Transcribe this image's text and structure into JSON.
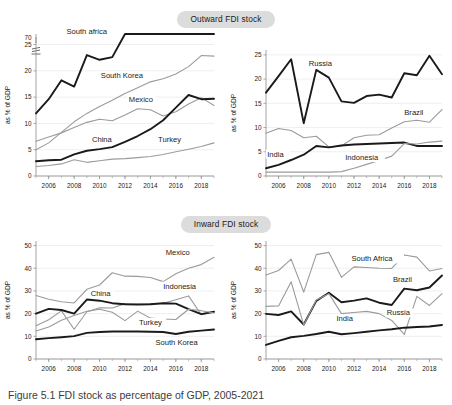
{
  "figure": {
    "caption": "Figure 5.1   FDI stock as percentage of GDP, 2005-2021"
  },
  "sections": [
    {
      "id": "outward",
      "title": "Outward FDI stock"
    },
    {
      "id": "inward",
      "title": "Inward FDI stock"
    }
  ],
  "axis": {
    "ylabel": "as % of GDP",
    "xticks": [
      "2006",
      "2008",
      "2010",
      "2012",
      "2014",
      "2016",
      "2018"
    ]
  },
  "colors": {
    "dark": "#1a1a1a",
    "grey": "#9b9b9b",
    "grid": "#e8e8e8",
    "pill": "#dcdcdc"
  },
  "chart_data": [
    {
      "id": "outward-left",
      "type": "line",
      "title": "Outward FDI stock",
      "xlabel": "",
      "ylabel": "as % of GDP",
      "x": [
        2005,
        2006,
        2007,
        2008,
        2009,
        2010,
        2011,
        2012,
        2013,
        2014,
        2015,
        2016,
        2017,
        2018,
        2019
      ],
      "xlim": [
        2005,
        2019
      ],
      "ylim": [
        0,
        27
      ],
      "yticks": [
        0,
        5,
        10,
        15,
        20,
        25
      ],
      "axis_break": {
        "after": 25,
        "label": "70",
        "note": "y-axis broken between 25 and 70"
      },
      "grid": true,
      "legend": "inline-labels",
      "series": [
        {
          "name": "South africa",
          "style": "dark",
          "values": [
            11.9,
            14.6,
            18.2,
            17.0,
            23.0,
            22.1,
            22.6,
            27.6,
            28.0,
            28.4,
            28.8,
            29.2,
            29.6,
            30.0,
            30.4
          ],
          "note": "values above 25 are drawn in the broken upper region",
          "label_x": 2007.4,
          "label_y": 30.6
        },
        {
          "name": "South Korea",
          "style": "grey",
          "values": [
            5.0,
            6.3,
            8.3,
            10.3,
            11.9,
            13.2,
            14.4,
            15.7,
            16.8,
            17.9,
            18.5,
            19.4,
            20.8,
            22.9,
            22.8
          ],
          "label_x": 2010.1,
          "label_y": 18.6
        },
        {
          "name": "Mexico",
          "style": "grey",
          "values": [
            6.6,
            7.4,
            8.2,
            9.2,
            10.2,
            10.8,
            10.5,
            11.6,
            12.8,
            12.6,
            11.4,
            12.2,
            13.7,
            14.9,
            13.4
          ],
          "label_x": 2012.3,
          "label_y": 14.1
        },
        {
          "name": "China",
          "style": "dark",
          "values": [
            2.8,
            3.0,
            3.1,
            4.1,
            4.8,
            5.1,
            5.5,
            6.5,
            7.6,
            8.9,
            10.6,
            13.0,
            15.4,
            14.6,
            14.7
          ],
          "label_x": 2009.4,
          "label_y": 6.5
        },
        {
          "name": "Turkey",
          "style": "grey",
          "values": [
            1.8,
            2.0,
            2.3,
            3.1,
            2.6,
            2.9,
            3.2,
            3.3,
            3.5,
            3.7,
            4.1,
            4.6,
            5.1,
            5.6,
            6.3
          ],
          "label_x": 2014.6,
          "label_y": 6.5
        }
      ]
    },
    {
      "id": "outward-right",
      "type": "line",
      "title": "Outward FDI stock",
      "xlabel": "",
      "ylabel": "as % of GDP",
      "x": [
        2005,
        2006,
        2007,
        2008,
        2009,
        2010,
        2011,
        2012,
        2013,
        2014,
        2015,
        2016,
        2017,
        2018,
        2019
      ],
      "xlim": [
        2005,
        2019
      ],
      "ylim": [
        0,
        26
      ],
      "yticks": [
        0,
        5,
        10,
        15,
        20,
        25
      ],
      "grid": true,
      "legend": "inline-labels",
      "series": [
        {
          "name": "Russia",
          "style": "dark",
          "values": [
            17.2,
            20.6,
            24.1,
            10.9,
            21.9,
            20.3,
            15.4,
            15.1,
            16.5,
            16.8,
            16.2,
            21.2,
            20.8,
            24.8,
            21.0,
            24.0
          ],
          "label_x": 2008.4,
          "label_y": 22.8
        },
        {
          "name": "Brazil",
          "style": "grey",
          "values": [
            8.8,
            9.8,
            9.4,
            7.9,
            8.2,
            6.0,
            6.2,
            7.9,
            8.4,
            8.5,
            9.9,
            11.2,
            11.5,
            11.1,
            13.7
          ],
          "label_x": 2016.0,
          "label_y": 12.6
        },
        {
          "name": "India",
          "style": "dark",
          "values": [
            1.6,
            2.3,
            3.3,
            4.4,
            6.2,
            5.9,
            6.3,
            6.5,
            6.6,
            6.7,
            6.8,
            6.9,
            6.2,
            6.2,
            6.2
          ],
          "label_x": 2005.1,
          "label_y": 4.0
        },
        {
          "name": "Indonesia",
          "style": "grey",
          "values": [
            0.8,
            0.8,
            0.8,
            0.8,
            0.8,
            0.8,
            0.9,
            1.6,
            2.4,
            3.2,
            4.1,
            6.7,
            6.6,
            7.0,
            7.2
          ],
          "label_x": 2011.3,
          "label_y": 3.3
        }
      ]
    },
    {
      "id": "inward-left",
      "type": "line",
      "title": "Inward FDI stock",
      "xlabel": "",
      "ylabel": "as % of GDP",
      "x": [
        2005,
        2006,
        2007,
        2008,
        2009,
        2010,
        2011,
        2012,
        2013,
        2014,
        2015,
        2016,
        2017,
        2018,
        2019
      ],
      "xlim": [
        2005,
        2019
      ],
      "ylim": [
        0,
        52
      ],
      "yticks": [
        0,
        10,
        20,
        30,
        40,
        50
      ],
      "grid": true,
      "legend": "inline-labels",
      "series": [
        {
          "name": "Mexico",
          "style": "grey",
          "values": [
            28.0,
            26.3,
            25.2,
            24.7,
            30.7,
            32.6,
            38.0,
            36.5,
            36.4,
            35.9,
            34.1,
            37.6,
            40.0,
            41.6,
            44.8
          ],
          "label_x": 2015.2,
          "label_y": 46.0
        },
        {
          "name": "Indonesia",
          "style": "grey",
          "values": [
            14.6,
            17.3,
            21.2,
            13.1,
            20.8,
            22.6,
            22.5,
            24.4,
            24.1,
            24.3,
            24.5,
            26.1,
            27.8,
            19.5,
            20.7
          ],
          "label_x": 2015.0,
          "label_y": 31.0
        },
        {
          "name": "China",
          "style": "dark",
          "values": [
            20.0,
            22.1,
            21.6,
            20.0,
            26.2,
            25.7,
            24.6,
            24.1,
            24.0,
            24.1,
            24.6,
            24.4,
            22.0,
            19.8,
            20.8
          ],
          "label_x": 2009.3,
          "label_y": 27.8
        },
        {
          "name": "Turkey",
          "style": "grey",
          "values": [
            12.3,
            14.1,
            17.1,
            19.2,
            21.0,
            21.9,
            20.6,
            16.9,
            21.1,
            18.0,
            17.6,
            17.4,
            21.9,
            21.3,
            20.3
          ],
          "label_x": 2013.1,
          "label_y": 15.0
        },
        {
          "name": "South Korea",
          "style": "dark",
          "values": [
            8.7,
            9.2,
            9.6,
            10.1,
            11.5,
            11.9,
            12.1,
            12.1,
            12.1,
            12.0,
            11.9,
            11.0,
            12.0,
            12.5,
            13.0
          ],
          "label_x": 2014.4,
          "label_y": 6.3
        }
      ]
    },
    {
      "id": "inward-right",
      "type": "line",
      "title": "Inward FDI stock",
      "xlabel": "",
      "ylabel": "as % of GDP",
      "x": [
        2005,
        2006,
        2007,
        2008,
        2009,
        2010,
        2011,
        2012,
        2013,
        2014,
        2015,
        2016,
        2017,
        2018,
        2019
      ],
      "xlim": [
        2005,
        2019
      ],
      "ylim": [
        0,
        52
      ],
      "yticks": [
        0,
        10,
        20,
        30,
        40,
        50
      ],
      "grid": true,
      "legend": "inline-labels",
      "series": [
        {
          "name": "South Africa",
          "style": "grey",
          "values": [
            37.0,
            39.0,
            44.0,
            29.5,
            46.0,
            47.0,
            36.0,
            40.6,
            40.3,
            40.0,
            39.9,
            45.8,
            44.9,
            38.8,
            39.9
          ],
          "label_x": 2011.8,
          "label_y": 43.0
        },
        {
          "name": "Brazil",
          "style": "dark",
          "values": [
            19.9,
            19.4,
            21.0,
            15.2,
            25.6,
            29.2,
            25.0,
            25.7,
            26.7,
            24.8,
            23.8,
            31.0,
            30.3,
            31.5,
            36.8
          ],
          "label_x": 2015.1,
          "label_y": 33.8
        },
        {
          "name": "Russia",
          "style": "grey",
          "values": [
            23.2,
            23.4,
            34.0,
            15.0,
            26.0,
            28.8,
            20.0,
            20.5,
            21.0,
            20.0,
            17.0,
            10.8,
            27.6,
            23.6,
            28.8
          ],
          "label_x": 2014.6,
          "label_y": 19.2
        },
        {
          "name": "India",
          "style": "dark",
          "values": [
            6.2,
            8.0,
            9.6,
            10.2,
            11.0,
            12.0,
            10.9,
            11.4,
            12.0,
            12.6,
            13.1,
            13.8,
            14.1,
            14.3,
            15.0
          ],
          "label_x": 2010.6,
          "label_y": 16.6
        }
      ]
    }
  ]
}
